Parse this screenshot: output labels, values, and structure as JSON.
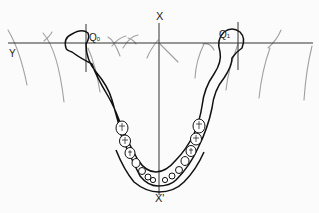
{
  "diagram": {
    "labels": {
      "x_top": "X",
      "x_bottom": "X'",
      "y": "Y",
      "q0_main": "Q",
      "q0_sub": "0",
      "q1_main": "Q",
      "q1_sub": "1"
    },
    "colors": {
      "outline": "#111111",
      "axis": "#333333",
      "guide_lines": "#9a9a9a",
      "background": "#fbfbfb"
    }
  }
}
